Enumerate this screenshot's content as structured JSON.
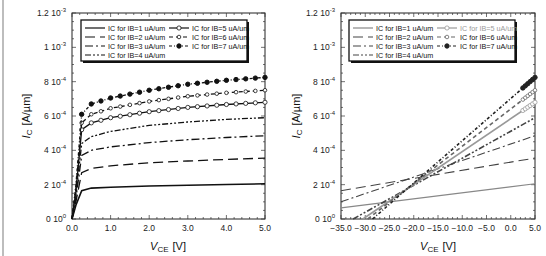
{
  "chart_data": [
    {
      "type": "line",
      "title": "",
      "xlabel": "V_CE [V]",
      "ylabel": "I_C [A/µm]",
      "xlim": [
        0,
        5
      ],
      "ylim": [
        0,
        0.0012
      ],
      "x_ticks": [
        "0.0",
        "1.0",
        "2.0",
        "3.0",
        "4.0",
        "5.0"
      ],
      "y_ticks": [
        "0 10^0",
        "2 10^-4",
        "4 10^-4",
        "6 10^-4",
        "8 10^-4",
        "1 10^-3",
        "1.2 10^-3"
      ],
      "grid": false,
      "legend_position": "upper center",
      "x": [
        0.0,
        0.1,
        0.25,
        0.5,
        1.0,
        2.0,
        3.0,
        4.0,
        5.0
      ],
      "series": [
        {
          "name": "IC for IB=1 uA/um",
          "values": [
            0,
            8e-05,
            0.000165,
            0.00018,
            0.000185,
            0.000192,
            0.000197,
            0.000201,
            0.000205
          ]
        },
        {
          "name": "IC for IB=2 uA/um",
          "values": [
            0,
            0.0001,
            0.00027,
            0.000295,
            0.00031,
            0.000328,
            0.000338,
            0.000347,
            0.000355
          ]
        },
        {
          "name": "IC for IB=3 uA/um",
          "values": [
            0,
            0.00012,
            0.00037,
            0.0004,
            0.00042,
            0.000445,
            0.000462,
            0.000475,
            0.000485
          ]
        },
        {
          "name": "IC for IB=4 uA/um",
          "values": [
            0,
            0.00014,
            0.00044,
            0.00048,
            0.00051,
            0.000545,
            0.000565,
            0.00058,
            0.00059
          ]
        },
        {
          "name": "IC for IB=5 uA/um",
          "values": [
            0,
            0.00016,
            0.00052,
            0.00056,
            0.00059,
            0.000625,
            0.00065,
            0.000667,
            0.00068
          ]
        },
        {
          "name": "IC for IB=6 uA/um",
          "values": [
            0,
            0.00018,
            0.00056,
            0.00061,
            0.000645,
            0.000685,
            0.000715,
            0.000735,
            0.00075
          ]
        },
        {
          "name": "IC for IB=7 uA/um",
          "values": [
            0,
            0.0002,
            0.00061,
            0.00067,
            0.000705,
            0.00075,
            0.000785,
            0.000808,
            0.000825
          ]
        }
      ]
    },
    {
      "type": "line",
      "title": "",
      "xlabel": "V_CE [V]",
      "ylabel": "I_C [A/µm]",
      "xlim": [
        -35,
        5
      ],
      "ylim": [
        0,
        0.0012
      ],
      "x_ticks": [
        "-35.0",
        "-30.0",
        "-25.0",
        "-20.0",
        "-15.0",
        "-10.0",
        "-5.0",
        "0.0",
        "5.0"
      ],
      "y_ticks": [
        "0 10^0",
        "2 10^-4",
        "4 10^-4",
        "6 10^-4",
        "8 10^-4",
        "1 10^-3",
        "1.2 10^-3"
      ],
      "grid": false,
      "legend_position": "upper center",
      "x": [
        -35,
        5
      ],
      "series": [
        {
          "name": "IC for IB=1 uA/um",
          "values": [
            6.5e-05,
            0.000205
          ],
          "color": "#888888"
        },
        {
          "name": "IC for IB=2 uA/um",
          "values": [
            0.000165,
            0.000355
          ],
          "color": "#444444"
        },
        {
          "name": "IC for IB=3 uA/um",
          "values": [
            0.0001,
            0.000485
          ],
          "color": "#444444"
        },
        {
          "name": "IC for IB=4 uA/um",
          "values": [
            0.0,
            0.00059
          ],
          "x_start": -32.5,
          "color": "#444444"
        },
        {
          "name": "IC for IB=5 uA/um",
          "values": [
            0.0,
            0.00068
          ],
          "x_start": -30.5,
          "color": "#999999"
        },
        {
          "name": "IC for IB=6 uA/um",
          "values": [
            0.0,
            0.00075
          ],
          "x_start": -29.5,
          "color": "#666666"
        },
        {
          "name": "IC for IB=7 uA/um",
          "values": [
            0.0,
            0.000825
          ],
          "x_start": -28.5,
          "color": "#222222"
        }
      ]
    }
  ],
  "left_chart": {
    "y_ticks": [
      {
        "mant": "0 10",
        "exp": "0"
      },
      {
        "mant": "2 10",
        "exp": "-4"
      },
      {
        "mant": "4 10",
        "exp": "-4"
      },
      {
        "mant": "6 10",
        "exp": "-4"
      },
      {
        "mant": "8 10",
        "exp": "-4"
      },
      {
        "mant": "1 10",
        "exp": "-3"
      },
      {
        "mant": "1.2 10",
        "exp": "-3"
      }
    ],
    "x_ticks": [
      "0.0",
      "1.0",
      "2.0",
      "3.0",
      "4.0",
      "5.0"
    ],
    "xlabel_main": "V",
    "xlabel_sub": "CE",
    "xlabel_unit": "[V]",
    "ylabel_main": "I",
    "ylabel_sub": "C",
    "ylabel_unit": "[A/µm]",
    "legend": [
      "IC for IB=1 uA/um",
      "IC for IB=2 uA/um",
      "IC for IB=3 uA/um",
      "IC for IB=4 uA/um",
      "IC for IB=5 uA/um",
      "IC for IB=6 uA/um",
      "IC for IB=7 uA/um"
    ]
  },
  "right_chart": {
    "y_ticks": [
      {
        "mant": "0 10",
        "exp": "0"
      },
      {
        "mant": "2 10",
        "exp": "-4"
      },
      {
        "mant": "4 10",
        "exp": "-4"
      },
      {
        "mant": "6 10",
        "exp": "-4"
      },
      {
        "mant": "8 10",
        "exp": "-4"
      },
      {
        "mant": "1 10",
        "exp": "-3"
      },
      {
        "mant": "1.2 10",
        "exp": "-3"
      }
    ],
    "x_ticks": [
      "−35.0",
      "−30.0",
      "−25.0",
      "−20.0",
      "−15.0",
      "−10.0",
      "−5.0",
      "0.0",
      "5.0"
    ],
    "xlabel_main": "V",
    "xlabel_sub": "CE",
    "xlabel_unit": "[V]",
    "ylabel_main": "I",
    "ylabel_sub": "C",
    "ylabel_unit": "[A/µm]",
    "legend": [
      "IC for IB=1 uA/um",
      "IC for IB=2 uA/um",
      "IC for IB=3 uA/um",
      "IC for IB=4 uA/um",
      "IC for IB=5 uA/um",
      "IC for IB=6 uA/um",
      "IC for IB=7 uA/um"
    ]
  }
}
